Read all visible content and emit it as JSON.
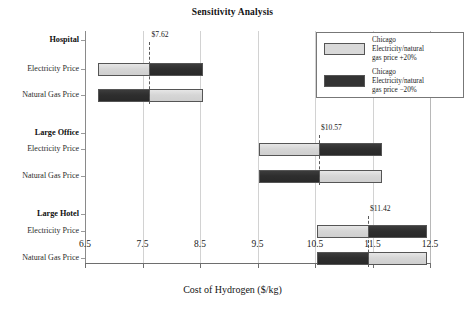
{
  "chart_data": {
    "type": "bar",
    "title": "Sensitivity Analysis",
    "subtitle": "",
    "xlabel": "Cost of Hydrogen ($/kg)",
    "ylabel": "",
    "xlim": [
      6.5,
      12.5
    ],
    "xticks": [
      6.5,
      7.5,
      8.5,
      9.5,
      10.5,
      11.5,
      12.5
    ],
    "xticklabels": [
      "6.5",
      "7.5",
      "8.5",
      "9.5",
      "10.5",
      "11.5",
      "12.5"
    ],
    "grid": true,
    "grid_axis": "x",
    "orientation": "horizontal",
    "legend_position": "upper right",
    "legend": [
      {
        "label": "Chicago\nElectricity/natural\ngas price  +20%",
        "color": "#d9d9d9"
      },
      {
        "label": "Chicago\nElectricity/natural\ngas price  −20%",
        "color": "#333333"
      }
    ],
    "groups": [
      {
        "name": "Hospital",
        "base_case": 7.62,
        "base_case_label": "$7.62",
        "bars": [
          {
            "category": "Electricity Price",
            "low": 6.73,
            "high": 8.55,
            "low_series": "+20%",
            "high_series": "−20%"
          },
          {
            "category": "Natural Gas Price",
            "low": 6.73,
            "high": 8.55,
            "low_series": "−20%",
            "high_series": "+20%"
          }
        ]
      },
      {
        "name": "Large Office",
        "base_case": 10.57,
        "base_case_label": "$10.57",
        "bars": [
          {
            "category": "Electricity Price",
            "low": 9.53,
            "high": 11.66,
            "low_series": "+20%",
            "high_series": "−20%"
          },
          {
            "category": "Natural Gas Price",
            "low": 9.53,
            "high": 11.66,
            "low_series": "−20%",
            "high_series": "+20%"
          }
        ]
      },
      {
        "name": "Large Hotel",
        "base_case": 11.42,
        "base_case_label": "$11.42",
        "bars": [
          {
            "category": "Electricity Price",
            "low": 10.53,
            "high": 12.45,
            "low_series": "+20%",
            "high_series": "−20%"
          },
          {
            "category": "Natural Gas Price",
            "low": 10.53,
            "high": 12.45,
            "low_series": "−20%",
            "high_series": "+20%"
          }
        ]
      }
    ],
    "colors": {
      "series_plus_20": "#d9d9d9",
      "series_minus_20": "#333333",
      "bar_edge": "#555555",
      "gridline": "#d2d2d2",
      "axis": "#6e6e6e",
      "baseline_marker": "#5a5a5a"
    }
  },
  "axis": {
    "x_title": "Cost of Hydrogen ($/kg)",
    "ticks": [
      "6.5",
      "7.5",
      "8.5",
      "9.5",
      "10.5",
      "11.5",
      "12.5"
    ]
  },
  "categories": {
    "group_1": "Hospital",
    "group_2": "Large Office",
    "group_3": "Large Hotel",
    "row_electricity": "Electricity Price",
    "row_natural_gas": "Natural Gas Price"
  },
  "markers": {
    "hospital": "$7.62",
    "large_office": "$10.57",
    "large_hotel": "$11.42"
  },
  "legend": {
    "entry_1": "Chicago\nElectricity/natural\ngas price  +20%",
    "entry_2": "Chicago\nElectricity/natural\ngas price  −20%"
  }
}
